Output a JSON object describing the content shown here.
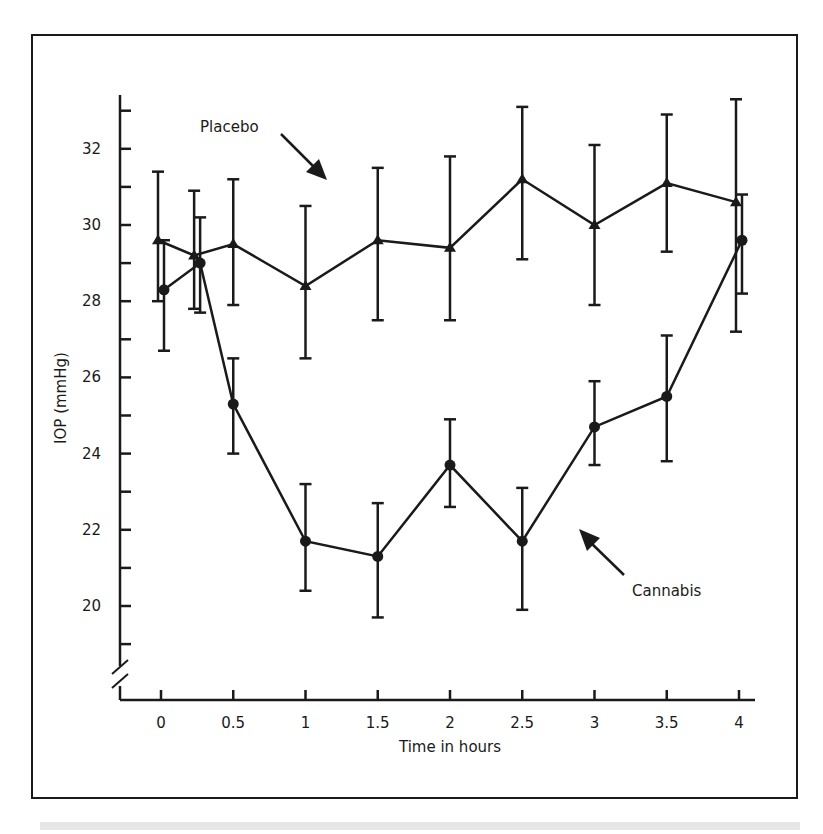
{
  "chart_data": {
    "type": "line",
    "title": "",
    "xlabel": "Time in hours",
    "ylabel": "IOP (mmHg)",
    "x": [
      0,
      0.25,
      0.5,
      1,
      1.5,
      2,
      2.5,
      3,
      3.5,
      4
    ],
    "x_ticks": [
      "0",
      "0.5",
      "1",
      "1.5",
      "2",
      "2.5",
      "3",
      "3.5",
      "4"
    ],
    "y_ticks": [
      "20",
      "22",
      "24",
      "26",
      "28",
      "30",
      "32"
    ],
    "ylim": [
      18.5,
      33.5
    ],
    "xlim": [
      -0.3,
      4.05
    ],
    "y_axis_break": true,
    "grid": false,
    "legend": "inline annotations with arrows",
    "series": [
      {
        "name": "Placebo",
        "marker": "triangle",
        "values": [
          29.6,
          29.2,
          29.5,
          28.4,
          29.6,
          29.4,
          31.2,
          30.0,
          31.1,
          30.6
        ],
        "error_low": [
          28.0,
          27.8,
          27.9,
          26.5,
          27.5,
          27.5,
          29.1,
          27.9,
          29.3,
          27.2
        ],
        "error_high": [
          31.4,
          30.9,
          31.2,
          30.5,
          31.5,
          31.8,
          33.1,
          32.1,
          32.9,
          33.3
        ]
      },
      {
        "name": "Cannabis",
        "marker": "circle",
        "values": [
          28.3,
          29.0,
          25.3,
          21.7,
          21.3,
          23.7,
          21.7,
          24.7,
          25.5,
          29.6
        ],
        "error_low": [
          26.7,
          27.7,
          24.0,
          20.4,
          19.7,
          22.6,
          19.9,
          23.7,
          23.8,
          28.2
        ],
        "error_high": [
          29.6,
          30.2,
          26.5,
          23.2,
          22.7,
          24.9,
          23.1,
          25.9,
          27.1,
          30.8
        ]
      }
    ],
    "annotations": [
      {
        "text": "Placebo",
        "points_to": "Placebo series near x=1"
      },
      {
        "text": "Cannabis",
        "points_to": "Cannabis series near x=2.8"
      }
    ]
  },
  "labels": {
    "placebo": "Placebo",
    "cannabis": "Cannabis",
    "xlabel": "Time in hours",
    "ylabel": "IOP (mmHg)"
  },
  "colors": {
    "ink": "#1a1a1a",
    "background": "#ffffff"
  }
}
